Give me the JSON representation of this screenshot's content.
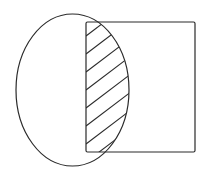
{
  "figure": {
    "stroke_color": "#2a2a2a",
    "background": "#ffffff",
    "ellipse": {
      "cx": 72.5,
      "cy": 90,
      "rx": 56.5,
      "ry": 76
    },
    "rectangle": {
      "x": 86,
      "y": 22,
      "width": 109,
      "height": 130
    },
    "hatch": {
      "region": "ellipse-intersect-rectangle",
      "direction": "up-right diagonal",
      "lines": [
        {
          "x1": 86,
          "y1": 36,
          "x2": 136,
          "y2": -2
        },
        {
          "x1": 86,
          "y1": 54,
          "x2": 136,
          "y2": 16
        },
        {
          "x1": 86,
          "y1": 72,
          "x2": 136,
          "y2": 34
        },
        {
          "x1": 86,
          "y1": 90,
          "x2": 136,
          "y2": 52
        },
        {
          "x1": 86,
          "y1": 108,
          "x2": 136,
          "y2": 70
        },
        {
          "x1": 86,
          "y1": 126,
          "x2": 136,
          "y2": 88
        },
        {
          "x1": 86,
          "y1": 144,
          "x2": 136,
          "y2": 106
        },
        {
          "x1": 86,
          "y1": 162,
          "x2": 136,
          "y2": 124
        },
        {
          "x1": 86,
          "y1": 180,
          "x2": 136,
          "y2": 142
        }
      ]
    }
  }
}
